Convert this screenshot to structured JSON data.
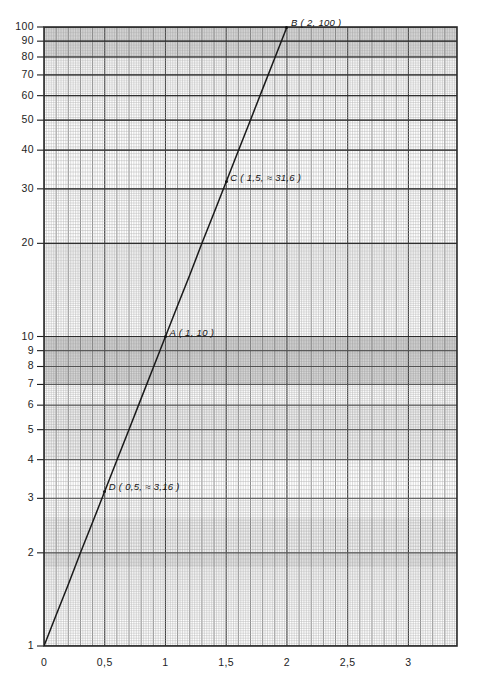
{
  "chart_data": {
    "type": "line",
    "title": "",
    "subtitle": "",
    "xlabel": "",
    "ylabel": "",
    "yscale": "log",
    "xscale": "linear",
    "xlim": [
      0,
      3.4
    ],
    "ylim": [
      1,
      100
    ],
    "grid": true,
    "grid_style": "semi-log graph paper, minor and major rulings",
    "legend": "none",
    "function": "y = 10^x",
    "series": [
      {
        "name": "y = 10^x",
        "x": [
          0,
          0.1,
          0.2,
          0.3,
          0.4,
          0.5,
          0.6,
          0.7,
          0.8,
          0.9,
          1.0,
          1.1,
          1.2,
          1.3,
          1.4,
          1.5,
          1.6,
          1.7,
          1.8,
          1.9,
          2.0
        ],
        "y": [
          1,
          1.26,
          1.58,
          2.0,
          2.51,
          3.16,
          3.98,
          5.01,
          6.31,
          7.94,
          10,
          12.6,
          15.8,
          20.0,
          25.1,
          31.6,
          39.8,
          50.1,
          63.1,
          79.4,
          100
        ]
      }
    ],
    "x_ticks": [
      0,
      0.5,
      1,
      1.5,
      2,
      2.5,
      3
    ],
    "x_tick_labels": [
      "0",
      "0,5",
      "1",
      "1,5",
      "2",
      "2,5",
      "3"
    ],
    "y_ticks": [
      1,
      2,
      3,
      4,
      5,
      6,
      7,
      8,
      9,
      10,
      20,
      30,
      40,
      50,
      60,
      70,
      80,
      90,
      100
    ],
    "y_tick_labels": [
      "1",
      "2",
      "3",
      "4",
      "5",
      "6",
      "7",
      "8",
      "9",
      "10",
      "20",
      "30",
      "40",
      "50",
      "60",
      "70",
      "80",
      "90",
      "100"
    ],
    "annotations": [
      {
        "id": "D",
        "label": "D ( 0,5,  ≈ 3,16 )",
        "x": 0.5,
        "y": 3.16
      },
      {
        "id": "A",
        "label": "A ( 1, 10 )",
        "x": 1.0,
        "y": 10
      },
      {
        "id": "C",
        "label": "C ( 1,5,  ≈ 31,6 )",
        "x": 1.5,
        "y": 31.6
      },
      {
        "id": "B",
        "label": "B ( 2, 100 )",
        "x": 2.0,
        "y": 100
      }
    ],
    "colors": {
      "curve": "#1a1a1a",
      "major_grid": "#555555",
      "minor_grid": "#999999",
      "border": "#2b2b2b",
      "background": "#ffffff",
      "tick_text": "#1d1d1d"
    }
  }
}
